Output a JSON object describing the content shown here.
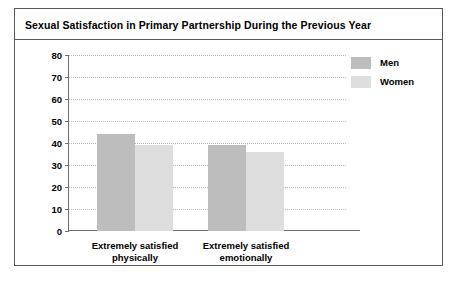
{
  "chart_data": {
    "type": "bar",
    "title": "Sexual Satisfaction in Primary Partnership During the Previous Year",
    "xlabel": "",
    "ylabel": "",
    "ylim": [
      0,
      80
    ],
    "yticks": [
      0,
      10,
      20,
      30,
      40,
      50,
      60,
      70,
      80
    ],
    "grid": true,
    "legend_position": "top-right",
    "categories": [
      "Extremely satisfied physically",
      "Extremely satisfied emotionally"
    ],
    "category_lines": [
      [
        "Extremely satisfied",
        "physically"
      ],
      [
        "Extremely satisfied",
        "emotionally"
      ]
    ],
    "series": [
      {
        "name": "Men",
        "color": "#bdbdbd",
        "values": [
          44,
          39
        ]
      },
      {
        "name": "Women",
        "color": "#dedede",
        "values": [
          39,
          36
        ]
      }
    ]
  },
  "colors": {
    "frame": "#5a5a5a",
    "axis": "#6e6e6e",
    "grid": "#b9b9b9",
    "men": "#bdbdbd",
    "women": "#dedede"
  }
}
